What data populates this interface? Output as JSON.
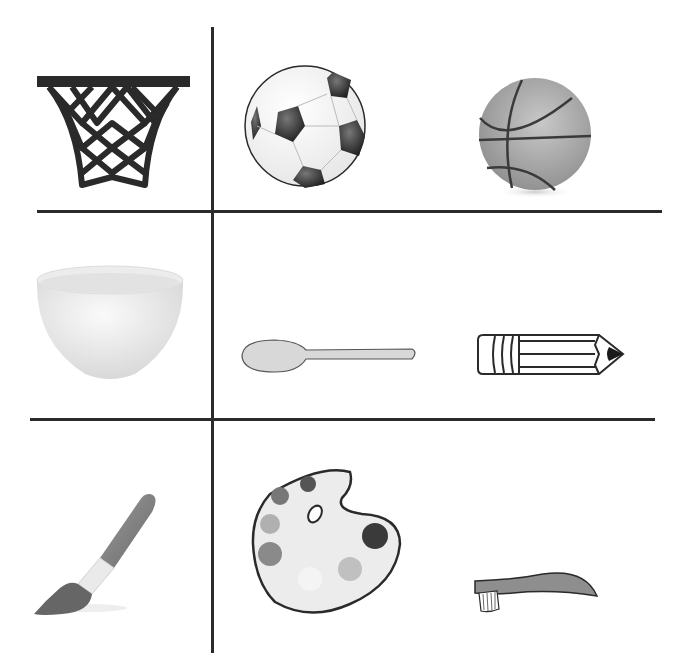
{
  "worksheet": {
    "rows": [
      {
        "items": [
          {
            "name": "basketball hoop",
            "icon": "basketball-hoop-icon"
          },
          {
            "name": "soccer ball",
            "icon": "soccer-ball-icon"
          },
          {
            "name": "basketball",
            "icon": "basketball-icon"
          }
        ]
      },
      {
        "items": [
          {
            "name": "bowl",
            "icon": "bowl-icon"
          },
          {
            "name": "spoon",
            "icon": "spoon-icon"
          },
          {
            "name": "pencil",
            "icon": "pencil-icon"
          }
        ]
      },
      {
        "items": [
          {
            "name": "paintbrush",
            "icon": "paintbrush-icon"
          },
          {
            "name": "paint palette",
            "icon": "palette-icon"
          },
          {
            "name": "toothbrush",
            "icon": "toothbrush-icon"
          }
        ]
      }
    ],
    "colors": {
      "line": "#2b2b2b",
      "dark": "#2a2a2a",
      "mid_gray": "#8a8a8a",
      "light_gray": "#cfcfcf",
      "background": "#ffffff"
    }
  }
}
